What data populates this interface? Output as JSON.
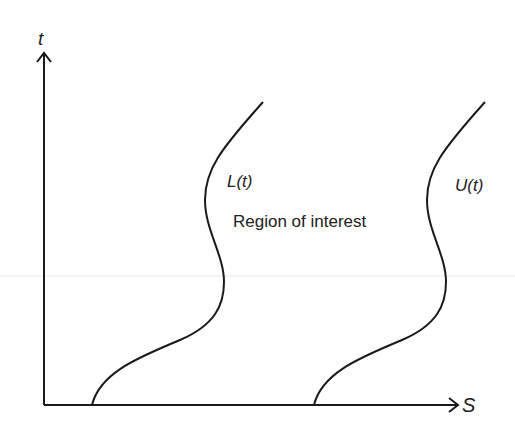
{
  "diagram": {
    "type": "boundary-curves",
    "axes": {
      "vertical_label": "t",
      "horizontal_label": "S"
    },
    "curves": [
      {
        "name": "lower-boundary",
        "label": "L(t)"
      },
      {
        "name": "upper-boundary",
        "label": "U(t)"
      }
    ],
    "region_label": "Region of interest",
    "colors": {
      "line": "#1a1a1a",
      "text": "#222222",
      "guide_line": "#e6e6e6",
      "background": "#ffffff"
    }
  }
}
